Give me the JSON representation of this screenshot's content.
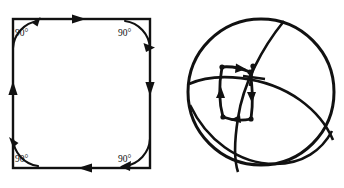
{
  "figure": {
    "title": "",
    "caption": "",
    "panels": [
      {
        "id": "left-panel",
        "name": "square-with-right-angles",
        "shape": "square",
        "description": "Closed square path traversed clockwise with four 90 degree corner angle marks",
        "angle_labels": [
          {
            "position": "top-left",
            "text": "90°",
            "x": 24,
            "y": 32
          },
          {
            "position": "top-right",
            "text": "90°",
            "x": 127,
            "y": 32
          },
          {
            "position": "bottom-left",
            "text": "90°",
            "x": 24,
            "y": 160
          },
          {
            "position": "bottom-right",
            "text": "90°",
            "x": 127,
            "y": 160
          }
        ],
        "traversal": [
          {
            "edge": "top",
            "direction": "right"
          },
          {
            "edge": "right",
            "direction": "down"
          },
          {
            "edge": "bottom",
            "direction": "left"
          },
          {
            "edge": "left",
            "direction": "up"
          }
        ],
        "geometry": {
          "left": 13,
          "top": 19,
          "right": 150,
          "bottom": 168
        }
      },
      {
        "id": "right-panel",
        "name": "sphere-with-parallel-transport-loop",
        "shape": "sphere",
        "description": "Sphere drawn with three great-circle arcs and a closed quadrilateral loop with direction arrows and a transported tangent vector",
        "geometry": {
          "cx": 261,
          "cy": 92,
          "r": 73
        },
        "loop_vertices": [
          {
            "x": 222,
            "y": 68
          },
          {
            "x": 248,
            "y": 72
          },
          {
            "x": 250,
            "y": 118
          },
          {
            "x": 224,
            "y": 115
          }
        ],
        "tangent_vector": {
          "x": 252,
          "y": 70,
          "label": ""
        }
      }
    ]
  },
  "colors": {
    "ink": "#111111",
    "background": "#ffffff"
  }
}
